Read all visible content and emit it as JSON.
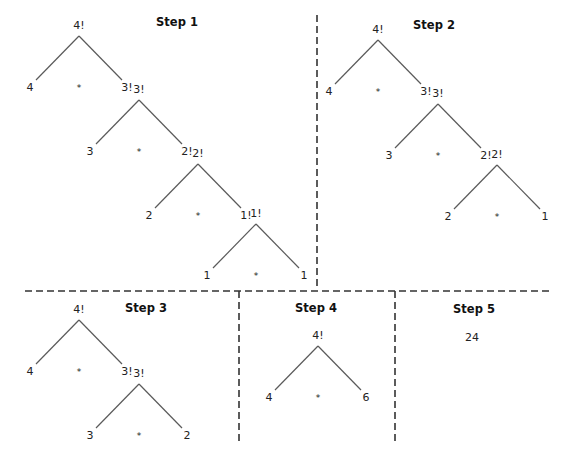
{
  "figure": {
    "caption_partial": "",
    "steps": [
      {
        "title": "Step 1",
        "title_pos": [
          177,
          26
        ],
        "trees": [
          {
            "root": "4!",
            "x": 79,
            "y": 29,
            "left": "4",
            "op": "*",
            "right": "3!"
          },
          {
            "root": "3!",
            "x": 139,
            "y": 93,
            "left": "3",
            "op": "*",
            "right": "2!"
          },
          {
            "root": "2!",
            "x": 198,
            "y": 157,
            "left": "2",
            "op": "*",
            "right": "1!"
          },
          {
            "root": "1!",
            "x": 256,
            "y": 217,
            "left": "1",
            "op": "*",
            "right": "1"
          }
        ]
      },
      {
        "title": "Step 2",
        "title_pos": [
          434,
          29
        ],
        "trees": [
          {
            "root": "4!",
            "x": 378,
            "y": 33,
            "left": "4",
            "op": "*",
            "right": "3!"
          },
          {
            "root": "3!",
            "x": 438,
            "y": 97,
            "left": "3",
            "op": "*",
            "right": "2!"
          },
          {
            "root": "2!",
            "x": 497,
            "y": 158,
            "left": "2",
            "op": "*",
            "right": "1"
          }
        ]
      },
      {
        "title": "Step 3",
        "title_pos": [
          146,
          312
        ],
        "trees": [
          {
            "root": "4!",
            "x": 79,
            "y": 313,
            "left": "4",
            "op": "*",
            "right": "3!"
          },
          {
            "root": "3!",
            "x": 139,
            "y": 377,
            "left": "3",
            "op": "*",
            "right": "2"
          }
        ]
      },
      {
        "title": "Step 4",
        "title_pos": [
          316,
          312
        ],
        "trees": [
          {
            "root": "4!",
            "x": 318,
            "y": 339,
            "left": "4",
            "op": "*",
            "right": "6"
          }
        ]
      },
      {
        "title": "Step 5",
        "title_pos": [
          474,
          313
        ],
        "result": "24",
        "result_pos": [
          472,
          341
        ]
      }
    ],
    "colors": {
      "edge": "#5a5a5a",
      "divider": "#333333",
      "text": "#222222"
    }
  }
}
